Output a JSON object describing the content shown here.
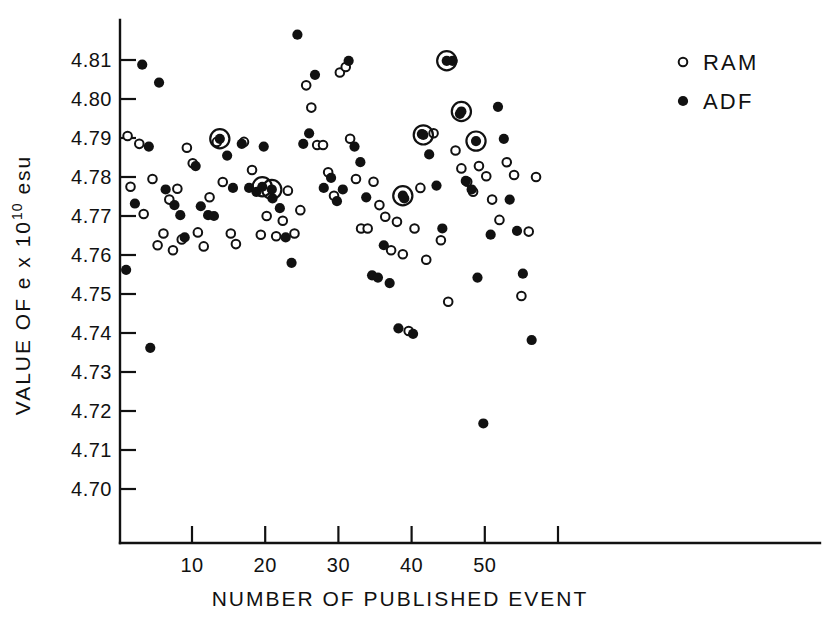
{
  "chart_data": {
    "type": "scatter",
    "title": "",
    "xlabel": "NUMBER OF PUBLISHED EVENT",
    "ylabel_parts": {
      "prefix": "VALUE OF e x 10",
      "exponent": "10",
      "suffix": " esu"
    },
    "ylabel": "VALUE OF e x 10^10 esu",
    "xlim": [
      0,
      62
    ],
    "ylim": [
      4.695,
      4.8165
    ],
    "grid": false,
    "xticks": [
      10,
      20,
      30,
      40,
      50,
      60
    ],
    "xticklabels": [
      "10",
      "20",
      "30",
      "40",
      "50",
      ""
    ],
    "yticks": [
      4.7,
      4.71,
      4.72,
      4.73,
      4.74,
      4.75,
      4.76,
      4.77,
      4.78,
      4.79,
      4.8,
      4.81
    ],
    "yticklabels": [
      "4.70",
      "4.71",
      "4.72",
      "4.73",
      "4.74",
      "4.75",
      "4.76",
      "4.77",
      "4.78",
      "4.79",
      "4.80",
      "4.81"
    ],
    "legend": {
      "position": "upper-right-outside",
      "entries": [
        {
          "label": "RAM",
          "marker": "open-circle"
        },
        {
          "label": "ADF",
          "marker": "filled-circle"
        }
      ]
    },
    "marker_styles": {
      "open-circle": {
        "fill": "#ffffff",
        "edge": "#111111"
      },
      "filled-circle": {
        "fill": "#111111",
        "edge": "#111111"
      },
      "ringed-filled-circle": {
        "fill": "#111111",
        "edge": "#111111",
        "ring": true
      }
    },
    "series": [
      {
        "name": "RAM",
        "marker": "open-circle",
        "points": [
          [
            1.2,
            4.7905
          ],
          [
            1.6,
            4.7775
          ],
          [
            2.8,
            4.7885
          ],
          [
            3.4,
            4.7705
          ],
          [
            4.6,
            4.7795
          ],
          [
            5.3,
            4.7625
          ],
          [
            6.1,
            4.7655
          ],
          [
            6.9,
            4.7742
          ],
          [
            7.4,
            4.7612
          ],
          [
            8.0,
            4.777
          ],
          [
            8.6,
            4.764
          ],
          [
            9.3,
            4.7875
          ],
          [
            10.1,
            4.7835
          ],
          [
            10.8,
            4.7658
          ],
          [
            11.6,
            4.7622
          ],
          [
            12.4,
            4.7748
          ],
          [
            13.4,
            4.789
          ],
          [
            14.2,
            4.7787
          ],
          [
            15.3,
            4.7655
          ],
          [
            16.0,
            4.7628
          ],
          [
            17.1,
            4.789
          ],
          [
            18.2,
            4.7818
          ],
          [
            19.4,
            4.7652
          ],
          [
            20.2,
            4.77
          ],
          [
            21.5,
            4.7648
          ],
          [
            22.4,
            4.7688
          ],
          [
            23.1,
            4.7765
          ],
          [
            24.0,
            4.7655
          ],
          [
            24.8,
            4.7715
          ],
          [
            25.6,
            4.8035
          ],
          [
            26.3,
            4.7978
          ],
          [
            27.1,
            4.7882
          ],
          [
            27.9,
            4.7882
          ],
          [
            28.6,
            4.7812
          ],
          [
            29.4,
            4.7752
          ],
          [
            30.2,
            4.8068
          ],
          [
            31.0,
            4.8082
          ],
          [
            31.6,
            4.7898
          ],
          [
            32.4,
            4.7795
          ],
          [
            33.1,
            4.7668
          ],
          [
            34.0,
            4.7668
          ],
          [
            34.8,
            4.7788
          ],
          [
            35.6,
            4.7728
          ],
          [
            36.4,
            4.7698
          ],
          [
            37.2,
            4.7612
          ],
          [
            38.0,
            4.7685
          ],
          [
            38.8,
            4.7602
          ],
          [
            39.6,
            4.7405
          ],
          [
            40.4,
            4.7668
          ],
          [
            41.2,
            4.7772
          ],
          [
            42.0,
            4.7588
          ],
          [
            43.0,
            4.7912
          ],
          [
            44.0,
            4.7638
          ],
          [
            45.0,
            4.748
          ],
          [
            46.0,
            4.7868
          ],
          [
            46.8,
            4.7822
          ],
          [
            47.6,
            4.7788
          ],
          [
            48.4,
            4.7762
          ],
          [
            49.2,
            4.7828
          ],
          [
            50.2,
            4.7802
          ],
          [
            51.0,
            4.7742
          ],
          [
            52.0,
            4.769
          ],
          [
            53.0,
            4.7838
          ],
          [
            54.0,
            4.7805
          ],
          [
            55.0,
            4.7495
          ],
          [
            56.0,
            4.766
          ],
          [
            57.0,
            4.78
          ]
        ]
      },
      {
        "name": "ADF",
        "marker": "filled-circle",
        "points": [
          [
            1.0,
            4.7562
          ],
          [
            2.2,
            4.7732
          ],
          [
            3.2,
            4.8088
          ],
          [
            4.1,
            4.7878
          ],
          [
            4.3,
            4.7362
          ],
          [
            5.5,
            4.8042
          ],
          [
            6.4,
            4.7768
          ],
          [
            7.6,
            4.7728
          ],
          [
            8.4,
            4.7702
          ],
          [
            9.0,
            4.7645
          ],
          [
            10.5,
            4.7828
          ],
          [
            11.2,
            4.7725
          ],
          [
            12.2,
            4.7702
          ],
          [
            13.0,
            4.77
          ],
          [
            14.8,
            4.7855
          ],
          [
            15.6,
            4.7772
          ],
          [
            16.8,
            4.7885
          ],
          [
            17.8,
            4.7772
          ],
          [
            18.8,
            4.7762
          ],
          [
            19.8,
            4.7878
          ],
          [
            21.0,
            4.7745
          ],
          [
            22.0,
            4.772
          ],
          [
            22.8,
            4.7645
          ],
          [
            23.6,
            4.758
          ],
          [
            24.4,
            4.8165
          ],
          [
            25.2,
            4.7885
          ],
          [
            26.0,
            4.7912
          ],
          [
            26.8,
            4.8062
          ],
          [
            28.0,
            4.7772
          ],
          [
            29.0,
            4.7798
          ],
          [
            29.8,
            4.7738
          ],
          [
            30.6,
            4.7768
          ],
          [
            31.4,
            4.8098
          ],
          [
            32.2,
            4.7878
          ],
          [
            33.0,
            4.7838
          ],
          [
            33.8,
            4.7748
          ],
          [
            34.6,
            4.7548
          ],
          [
            35.4,
            4.7542
          ],
          [
            36.2,
            4.7625
          ],
          [
            37.0,
            4.7528
          ],
          [
            38.2,
            4.7412
          ],
          [
            39.0,
            4.7745
          ],
          [
            40.2,
            4.7398
          ],
          [
            41.4,
            4.791
          ],
          [
            42.4,
            4.7858
          ],
          [
            43.4,
            4.7778
          ],
          [
            44.2,
            4.7668
          ],
          [
            45.6,
            4.8098
          ],
          [
            46.6,
            4.7962
          ],
          [
            47.4,
            4.779
          ],
          [
            48.2,
            4.7768
          ],
          [
            49.0,
            4.7542
          ],
          [
            49.8,
            4.7168
          ],
          [
            50.8,
            4.7652
          ],
          [
            51.8,
            4.798
          ],
          [
            52.6,
            4.7898
          ],
          [
            53.4,
            4.7742
          ],
          [
            54.4,
            4.7662
          ],
          [
            55.2,
            4.7552
          ],
          [
            56.4,
            4.7382
          ]
        ]
      },
      {
        "name": "highlighted",
        "marker": "ringed-filled-circle",
        "points": [
          [
            13.8,
            4.7898
          ],
          [
            19.6,
            4.7775
          ],
          [
            20.9,
            4.7768
          ],
          [
            38.8,
            4.7752
          ],
          [
            41.6,
            4.7908
          ],
          [
            44.8,
            4.8098
          ],
          [
            46.8,
            4.7968
          ],
          [
            48.8,
            4.7892
          ]
        ]
      }
    ]
  }
}
